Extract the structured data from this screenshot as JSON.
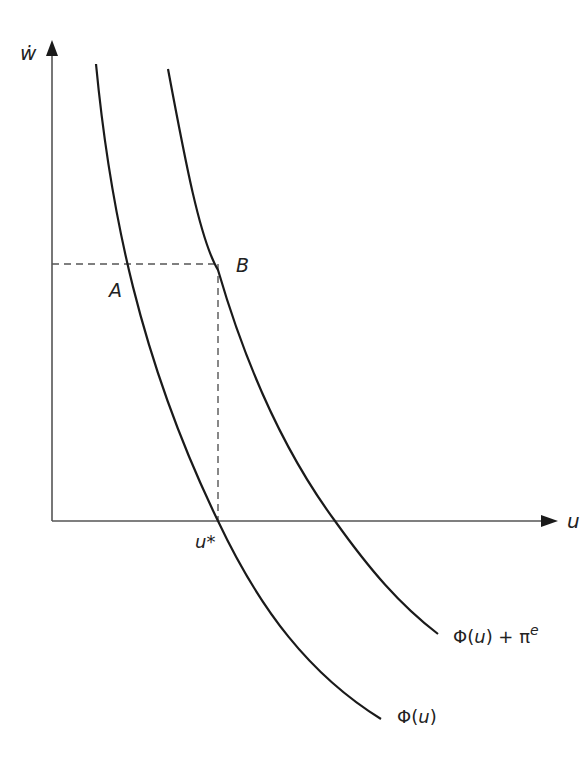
{
  "diagram": {
    "axes": {
      "y_label": "ẇ",
      "x_label": "u"
    },
    "curves": [
      {
        "id": "phi",
        "label_main": "Φ(",
        "label_var": "u",
        "label_close": ")"
      },
      {
        "id": "phi_plus_pi",
        "label_main": "Φ(",
        "label_var": "u",
        "label_close": ") + π",
        "label_sup": "e"
      }
    ],
    "points": [
      {
        "id": "A",
        "label": "A"
      },
      {
        "id": "B",
        "label": "B"
      }
    ],
    "markers": {
      "u_star": "u*"
    },
    "colors": {
      "curve": "#1a1a1a",
      "axis": "#555555",
      "dashed": "#555555",
      "background": "#ffffff"
    }
  }
}
